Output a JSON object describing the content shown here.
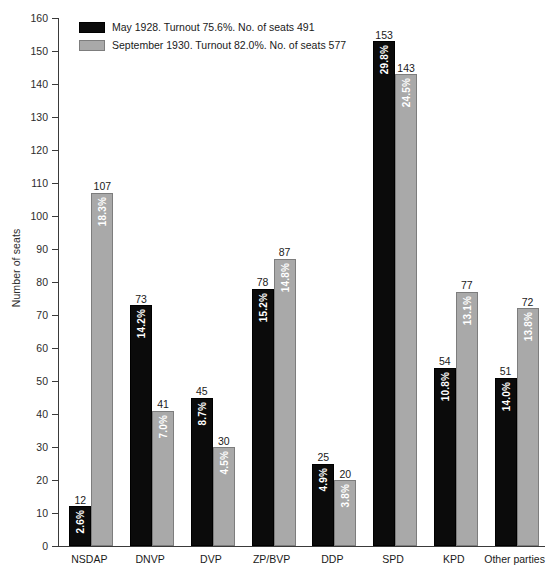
{
  "chart_data": {
    "type": "bar",
    "title": "",
    "xlabel": "",
    "ylabel": "Number of seats",
    "ylim": [
      0,
      160
    ],
    "ytick_step": 10,
    "yticks": [
      0,
      10,
      20,
      30,
      40,
      50,
      60,
      70,
      80,
      90,
      100,
      110,
      120,
      130,
      140,
      150,
      160
    ],
    "grid": false,
    "legend_position": "top-left",
    "categories": [
      "NSDAP",
      "DNVP",
      "DVP",
      "ZP/BVP",
      "DDP",
      "SPD",
      "KPD",
      "Other parties"
    ],
    "series": [
      {
        "name": "May 1928. Turnout 75.6%. No. of seats 491",
        "short_name": "May 1928",
        "color": "#0b0b0b",
        "values": [
          12,
          73,
          45,
          78,
          25,
          153,
          54,
          51
        ],
        "percent_labels": [
          "2.6%",
          "14.2%",
          "8.7%",
          "15.2%",
          "4.9%",
          "29.8%",
          "10.8%",
          "14.0%"
        ]
      },
      {
        "name": "September 1930. Turnout 82.0%. No. of seats 577",
        "short_name": "September 1930",
        "color": "#a9a9a9",
        "values": [
          107,
          41,
          30,
          87,
          20,
          143,
          77,
          72
        ],
        "percent_labels": [
          "18.3%",
          "7.0%",
          "4.5%",
          "14.8%",
          "3.8%",
          "24.5%",
          "13.1%",
          "13.8%"
        ]
      }
    ]
  },
  "legend": {
    "items": [
      {
        "label": "May 1928. Turnout 75.6%. No. of seats 491",
        "swatch": "dark"
      },
      {
        "label": "September 1930. Turnout 82.0%. No. of seats 577",
        "swatch": "light"
      }
    ]
  },
  "axes": {
    "y_title": "Number of seats"
  }
}
